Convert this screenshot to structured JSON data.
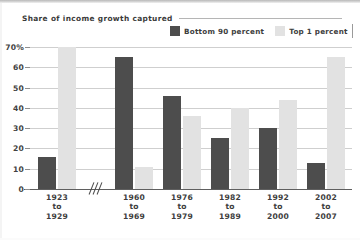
{
  "chart_data": {
    "type": "bar",
    "title": "Share of income growth captured",
    "xlabel": "",
    "ylabel": "",
    "ylim": [
      0,
      70
    ],
    "yticks": [
      "70%",
      "60",
      "50",
      "40",
      "30",
      "20",
      "10",
      "0"
    ],
    "ytick_values": [
      70,
      60,
      50,
      40,
      30,
      20,
      10,
      0
    ],
    "grid": true,
    "legend_position": "top-right",
    "axis_break_after_category": 1,
    "categories": [
      "1923 to 1929",
      "1960 to 1969",
      "1976 to 1979",
      "1982 to 1989",
      "1992 to 2000",
      "2002 to 2007"
    ],
    "category_lines": [
      [
        "1923",
        "to",
        "1929"
      ],
      [
        "1960",
        "to",
        "1969"
      ],
      [
        "1976",
        "to",
        "1979"
      ],
      [
        "1982",
        "to",
        "1989"
      ],
      [
        "1992",
        "to",
        "2000"
      ],
      [
        "2002",
        "to",
        "2007"
      ]
    ],
    "series": [
      {
        "name": "Bottom 90 percent",
        "color": "#4d4d4d",
        "values": [
          16,
          65,
          46,
          25,
          30,
          13
        ]
      },
      {
        "name": "Top 1 percent",
        "color": "#e2e2e2",
        "values": [
          70,
          11,
          36,
          40,
          44,
          65
        ]
      }
    ]
  },
  "legend": {
    "entries": [
      {
        "label": "Bottom 90 percent",
        "swatch": "dark-swatch"
      },
      {
        "label": "Top 1 percent",
        "swatch": "light-swatch"
      }
    ]
  },
  "colors": {
    "bottom90": "#4d4d4d",
    "top1": "#e2e2e2",
    "gridline": "#cfcfcf",
    "axis": "#5f5f5f",
    "text": "#3d3d3d",
    "background": "#ffffff"
  }
}
